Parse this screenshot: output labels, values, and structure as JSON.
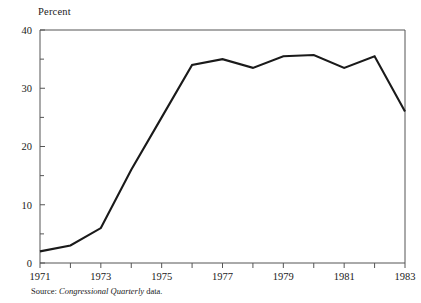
{
  "chart_data": {
    "type": "line",
    "title": "",
    "subtitle": "",
    "xlabel": "",
    "ylabel": "Percent",
    "ylim": [
      0,
      40
    ],
    "xlim": [
      1971,
      1983
    ],
    "grid": false,
    "legend": null,
    "x": [
      1971,
      1972,
      1973,
      1974,
      1975,
      1976,
      1977,
      1978,
      1979,
      1980,
      1981,
      1982,
      1983
    ],
    "series": [
      {
        "name": "Percent",
        "color": "#1a1a1a",
        "values": [
          2,
          3,
          6,
          16,
          25,
          34,
          35,
          33.5,
          35.5,
          35.7,
          33.5,
          35.5,
          26
        ]
      }
    ],
    "y_major_ticks": [
      0,
      10,
      20,
      30,
      40
    ],
    "y_major_tick_labels": [
      "0",
      "10",
      "20",
      "30",
      "40"
    ],
    "y_minor_ticks": [
      5,
      15,
      25,
      35
    ],
    "x_ticks": [
      1971,
      1972,
      1973,
      1974,
      1975,
      1976,
      1977,
      1978,
      1979,
      1980,
      1981,
      1982,
      1983
    ],
    "x_tick_labels": [
      "1971",
      "",
      "1973",
      "",
      "1975",
      "",
      "1977",
      "",
      "1979",
      "",
      "1981",
      "",
      "1983"
    ],
    "annotations": []
  },
  "source": {
    "label": "Source:",
    "publication": "Congressional Quarterly",
    "tail": "data."
  },
  "colors": {
    "line": "#1a1a1a",
    "axis": "#555555",
    "text": "#1a1a1a",
    "background": "#ffffff"
  }
}
